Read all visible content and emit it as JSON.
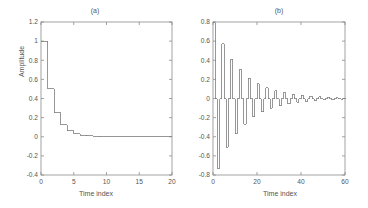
{
  "figure": {
    "background": "#ffffff",
    "line_color": "#7d7d7d",
    "axis_color": "#8c8c8c",
    "text_color": "#555555"
  },
  "panels": [
    {
      "id": "a",
      "title": "(a)",
      "xlabel": "Time index",
      "ylabel": "Amplitude"
    },
    {
      "id": "b",
      "title": "(b)",
      "xlabel": "Time index",
      "ylabel": ""
    }
  ],
  "chart_data": [
    {
      "type": "line",
      "title": "(a)",
      "xlabel": "Time index",
      "ylabel": "Amplitude",
      "xlim": [
        0,
        20
      ],
      "ylim": [
        -0.4,
        1.2
      ],
      "xticks": [
        0,
        5,
        10,
        15,
        20
      ],
      "xticklabels": [
        "0",
        "5",
        "10",
        "15",
        "20"
      ],
      "yticks": [
        -0.4,
        -0.2,
        0,
        0.2,
        0.4,
        0.6,
        0.8,
        1,
        1.2
      ],
      "yticklabels": [
        "-0.4",
        "-0.2",
        "0",
        "0.2",
        "0.4",
        "0.6",
        "0.8",
        "1",
        "1.2"
      ],
      "grid": false,
      "drawstyle": "steps-post",
      "legend": "none",
      "x": [
        0,
        1,
        2,
        3,
        4,
        5,
        6,
        7,
        8,
        9,
        10,
        11,
        12,
        13,
        14,
        15,
        16,
        17,
        18,
        19,
        20
      ],
      "values": [
        1.0,
        0.5,
        0.25,
        0.125,
        0.0625,
        0.031,
        0.016,
        0.008,
        0.004,
        0.002,
        0.001,
        0.0005,
        0.0002,
        0.0001,
        0.0,
        0.0,
        0.0,
        0.0,
        0.0,
        0.0,
        0.0
      ]
    },
    {
      "type": "line",
      "title": "(b)",
      "xlabel": "Time index",
      "ylabel": "",
      "xlim": [
        0,
        60
      ],
      "ylim": [
        -0.8,
        0.8
      ],
      "xticks": [
        0,
        20,
        40,
        60
      ],
      "xticklabels": [
        "0",
        "20",
        "40",
        "60"
      ],
      "yticks": [
        -0.8,
        -0.6,
        -0.4,
        -0.2,
        0,
        0.2,
        0.4,
        0.6,
        0.8
      ],
      "yticklabels": [
        "-0.8",
        "-0.6",
        "-0.4",
        "-0.2",
        "0",
        "0.2",
        "0.4",
        "0.6",
        "0.8"
      ],
      "grid": false,
      "drawstyle": "steps-post",
      "legend": "none",
      "x": [
        0,
        1,
        2,
        3,
        4,
        5,
        6,
        7,
        8,
        9,
        10,
        11,
        12,
        13,
        14,
        15,
        16,
        17,
        18,
        19,
        20,
        21,
        22,
        23,
        24,
        25,
        26,
        27,
        28,
        29,
        30,
        31,
        32,
        33,
        34,
        35,
        36,
        37,
        38,
        39,
        40,
        41,
        42,
        43,
        44,
        45,
        46,
        47,
        48,
        49,
        50,
        51,
        52,
        53,
        54,
        55,
        56,
        57,
        58,
        59,
        60
      ],
      "values": [
        0.79,
        0.0,
        -0.73,
        0.0,
        0.57,
        0.0,
        -0.51,
        0.0,
        0.41,
        0.0,
        -0.37,
        0.0,
        0.3,
        0.0,
        -0.27,
        0.0,
        0.21,
        0.0,
        -0.19,
        0.0,
        0.155,
        0.0,
        -0.14,
        0.0,
        0.115,
        0.0,
        -0.1,
        0.0,
        0.082,
        0.0,
        -0.074,
        0.0,
        0.06,
        0.0,
        -0.054,
        0.0,
        0.044,
        0.0,
        -0.039,
        0.0,
        0.032,
        0.0,
        -0.029,
        0.0,
        0.023,
        0.0,
        -0.021,
        0.0,
        0.017,
        0.0,
        -0.015,
        0.0,
        0.012,
        0.0,
        -0.011,
        0.0,
        0.009,
        0.0,
        -0.008,
        0.0,
        0.006
      ]
    }
  ]
}
